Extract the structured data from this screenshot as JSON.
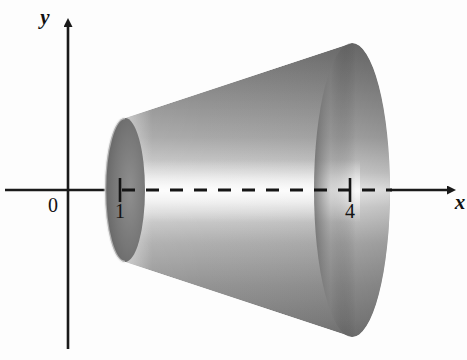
{
  "figure": {
    "domain": "diagram",
    "kind": "solid-of-revolution-frustum",
    "background_color": "#fdfdfd",
    "axes": {
      "x_axis_label": "x",
      "y_axis_label": "y",
      "origin_label": "0",
      "axis_color": "#1a1a1a",
      "x_axis": {
        "start_x": 5,
        "end_x": 456,
        "y": 190,
        "arrow": "right"
      },
      "y_axis": {
        "x": 68,
        "start_y": 18,
        "end_y": 349,
        "arrow": "up"
      }
    },
    "ticks": [
      {
        "label": "1",
        "x": 120,
        "y": 190
      },
      {
        "label": "4",
        "x": 350,
        "y": 190
      }
    ],
    "axis_of_revolution": {
      "style": "dashed",
      "from_x": 122,
      "to_x": 392,
      "y": 190,
      "dash_length": 13,
      "gap_length": 11,
      "color": "#151515"
    },
    "solid": {
      "description": "Frustum (truncated cone) formed by revolving a region about the x-axis between x = 1 and x = 4",
      "left_face": {
        "center_x": 125,
        "center_y": 190,
        "rx": 20,
        "ry": 72
      },
      "right_face": {
        "center_x": 352,
        "center_y": 190,
        "rx": 38,
        "ry": 147
      },
      "top_silhouette": {
        "from": [
          125,
          118
        ],
        "to": [
          352,
          43
        ]
      },
      "bottom_silhouette": {
        "from": [
          125,
          262
        ],
        "to": [
          352,
          337
        ]
      },
      "shading": {
        "body_dark": "#8a8a8a",
        "body_highlight": "#f4f4f4",
        "rim_dark": "#6f6f6f",
        "cavity_dark": "#5e5e5e",
        "right_face_light": "#c9c9c9",
        "right_face_shadow": "#7d7d7d"
      }
    }
  }
}
